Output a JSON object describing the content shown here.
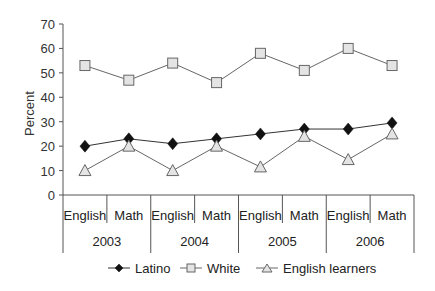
{
  "chart_data": {
    "type": "line",
    "title": "",
    "xlabel": "",
    "ylabel": "Percent",
    "ylim": [
      0,
      70
    ],
    "yticks": [
      0,
      10,
      20,
      30,
      40,
      50,
      60,
      70
    ],
    "grid": false,
    "legend_position": "bottom",
    "groups": [
      "2003",
      "2004",
      "2005",
      "2006"
    ],
    "subcategories": [
      "English",
      "Math"
    ],
    "categories": [
      "2003 English",
      "2003 Math",
      "2004 English",
      "2004 Math",
      "2005 English",
      "2005 Math",
      "2006 English",
      "2006 Math"
    ],
    "series": [
      {
        "name": "Latino",
        "marker": "diamond",
        "values": [
          20,
          23,
          21,
          23,
          25,
          27,
          27,
          29.5
        ]
      },
      {
        "name": "White",
        "marker": "square",
        "values": [
          53,
          47,
          54,
          46,
          58,
          51,
          60,
          53
        ]
      },
      {
        "name": "English learners",
        "marker": "triangle",
        "values": [
          10,
          20,
          10,
          20,
          11.5,
          24,
          14.5,
          25
        ]
      }
    ]
  },
  "axis": {
    "ylabel": "Percent"
  },
  "legend": {
    "latino": "Latino",
    "white": "White",
    "english_learners": "English learners"
  }
}
